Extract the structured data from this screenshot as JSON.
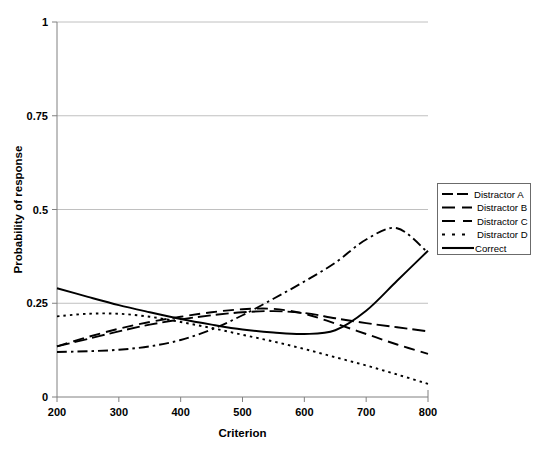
{
  "chart_data": {
    "type": "line",
    "title": "",
    "xlabel": "Criterion",
    "ylabel": "Probability of response",
    "xlim": [
      200,
      800
    ],
    "ylim": [
      0,
      1
    ],
    "xticks": [
      "200",
      "300",
      "400",
      "500",
      "600",
      "700",
      "800"
    ],
    "yticks": [
      "0",
      "0.25",
      "0.5",
      "0.75",
      "1"
    ],
    "grid": "horizontal",
    "legend_position": "right-outside",
    "x": [
      200,
      250,
      300,
      350,
      400,
      450,
      500,
      550,
      600,
      650,
      700,
      750,
      800
    ],
    "series": [
      {
        "name": "Distractor A",
        "style": "long-dash",
        "values": [
          0.135,
          0.155,
          0.175,
          0.193,
          0.207,
          0.218,
          0.226,
          0.229,
          0.224,
          0.21,
          0.197,
          0.186,
          0.175
        ]
      },
      {
        "name": "Distractor B",
        "style": "dash",
        "values": [
          0.135,
          0.16,
          0.182,
          0.2,
          0.214,
          0.226,
          0.234,
          0.235,
          0.222,
          0.196,
          0.168,
          0.14,
          0.115
        ]
      },
      {
        "name": "Distractor C",
        "style": "dash-dot",
        "values": [
          0.12,
          0.122,
          0.126,
          0.135,
          0.152,
          0.18,
          0.218,
          0.262,
          0.308,
          0.358,
          0.42,
          0.45,
          0.385
        ]
      },
      {
        "name": "Distractor D",
        "style": "dotted",
        "values": [
          0.215,
          0.222,
          0.222,
          0.214,
          0.2,
          0.184,
          0.166,
          0.148,
          0.128,
          0.106,
          0.084,
          0.06,
          0.035
        ]
      },
      {
        "name": "Correct",
        "style": "solid",
        "values": [
          0.29,
          0.267,
          0.245,
          0.226,
          0.208,
          0.193,
          0.18,
          0.172,
          0.168,
          0.178,
          0.23,
          0.31,
          0.39
        ]
      }
    ]
  },
  "axes": {
    "x_title": "Criterion",
    "y_title": "Probability of response"
  },
  "legend": {
    "entries": [
      {
        "label": "Distractor A"
      },
      {
        "label": "Distractor B"
      },
      {
        "label": "Distractor C"
      },
      {
        "label": "Distractor D"
      },
      {
        "label": "Correct"
      }
    ]
  }
}
